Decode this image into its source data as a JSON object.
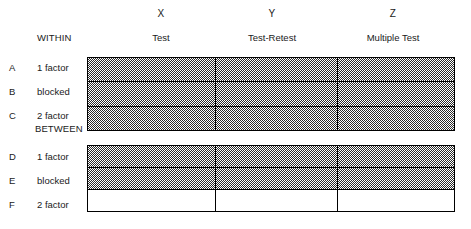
{
  "figure": {
    "title_present": false,
    "column_headers": [
      {
        "symbol": "X",
        "name": "Test"
      },
      {
        "symbol": "Y",
        "name": "Test-Retest"
      },
      {
        "symbol": "Z",
        "name": "Multiple Test"
      }
    ],
    "section_labels": {
      "within": "WITHIN",
      "between": "BETWEEN"
    },
    "sections": [
      {
        "id": "within",
        "label": "WITHIN",
        "rows": [
          {
            "letter": "A",
            "name": "1 factor",
            "cells": [
              "shaded",
              "shaded",
              "shaded"
            ]
          },
          {
            "letter": "B",
            "name": "blocked",
            "cells": [
              "shaded",
              "shaded",
              "shaded"
            ]
          },
          {
            "letter": "C",
            "name": "2 factor",
            "cells": [
              "shaded",
              "shaded",
              "shaded"
            ]
          }
        ]
      },
      {
        "id": "between",
        "label": "BETWEEN",
        "rows": [
          {
            "letter": "D",
            "name": "1 factor",
            "cells": [
              "shaded",
              "shaded",
              "shaded"
            ]
          },
          {
            "letter": "E",
            "name": "blocked",
            "cells": [
              "shaded",
              "shaded",
              "shaded"
            ]
          },
          {
            "letter": "F",
            "name": "2 factor",
            "cells": [
              "unshaded",
              "unshaded",
              "unshaded"
            ]
          }
        ]
      }
    ],
    "colors": {
      "ink": "#000000",
      "text": "#1a1a1a",
      "fill_pattern": "#2b2b2b",
      "background": "#ffffff"
    }
  }
}
